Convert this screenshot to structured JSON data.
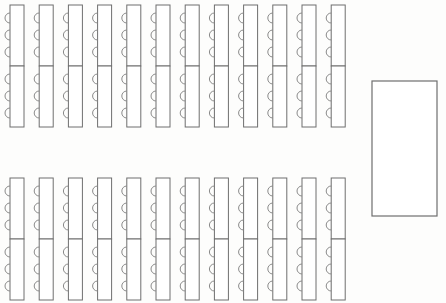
{
  "document": {
    "kind": "banquet-floor-plan",
    "title": "Banquet Seating Floor Plan",
    "background_color": "#fdfdfc",
    "line_color": "#6e6e6e",
    "chair_line_color": "#8a8a8a",
    "fill_color": "#ffffff",
    "width": 446,
    "height": 303
  },
  "layout": {
    "table_groups": [
      {
        "name": "upper-table-block",
        "label": "Upper table block",
        "columns": 12,
        "tables_per_column": 2,
        "chairs_per_table": 3,
        "chair_side": "left",
        "origin_x": 10,
        "origin_y": 5,
        "column_pitch": 29.2,
        "table_width": 14,
        "table_height": 61,
        "chair_radius": 5,
        "chair_pitch": 17,
        "chair_first_offset": 13
      },
      {
        "name": "lower-table-block",
        "label": "Lower table block",
        "columns": 12,
        "tables_per_column": 2,
        "chairs_per_table": 3,
        "chair_side": "left",
        "origin_x": 10,
        "origin_y": 178,
        "column_pitch": 29.2,
        "table_width": 14,
        "table_height": 61,
        "chair_radius": 5,
        "chair_pitch": 17,
        "chair_first_offset": 13
      }
    ],
    "stage": {
      "name": "stage-area",
      "label": "Stage",
      "x": 372,
      "y": 81,
      "width": 65,
      "height": 135
    }
  },
  "totals": {
    "table_count": 48,
    "seat_count": 144,
    "column_count": 24
  }
}
